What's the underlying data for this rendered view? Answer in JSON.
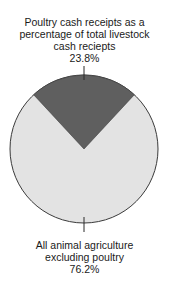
{
  "chart_data": {
    "type": "pie",
    "title": "",
    "slices": [
      {
        "label": "Poultry cash receipts as a percentage of total livestock cash reciepts",
        "value": 23.8,
        "value_label": "23.8%",
        "color": "#5f5f5f"
      },
      {
        "label": "All animal agriculture excluding poultry",
        "value": 76.2,
        "value_label": "76.2%",
        "color": "#e3e3e3"
      }
    ],
    "start_angle_deg": -42.8,
    "legend": "none",
    "annotations": "labels with leader lines above and below the pie"
  },
  "labels": {
    "top": {
      "line1": "Poultry cash receipts as a",
      "line2": "percentage of total livestock",
      "line3": "cash reciepts",
      "value": "23.8%"
    },
    "bottom": {
      "line1": "All animal agriculture",
      "line2": "excluding poultry",
      "value": "76.2%"
    }
  },
  "colors": {
    "poultry_slice": "#5f5f5f",
    "other_slice": "#e3e3e3",
    "outline": "#3a3a3a"
  }
}
